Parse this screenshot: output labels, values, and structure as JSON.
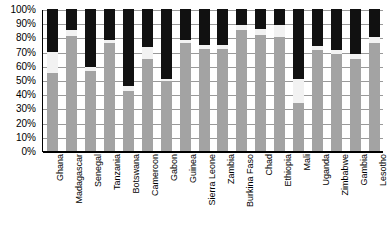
{
  "chart_data": {
    "type": "bar",
    "subtype": "stacked-bar-100-percent",
    "title": "",
    "xlabel": "",
    "ylabel": "",
    "ylim": [
      0,
      100
    ],
    "grid": true,
    "legend": "none",
    "orientation": "vertical",
    "stacked": true,
    "y_tick_labels": [
      "100%",
      "90%",
      "80%",
      "70%",
      "60%",
      "50%",
      "40%",
      "30%",
      "20%",
      "10%",
      "0%"
    ],
    "y_tick_values": [
      100,
      90,
      80,
      70,
      60,
      50,
      40,
      30,
      20,
      10,
      0
    ],
    "categories": [
      "Ghana",
      "Madagascar",
      "Senegal",
      "Tanzania",
      "Botswana",
      "Cameroon",
      "Gabon",
      "Guinea",
      "Sierra Leone",
      "Zambia",
      "Burkina Faso",
      "Chad",
      "Ethiopia",
      "Mali",
      "Uganda",
      "Zimbabwe",
      "Gambia",
      "Lesotho"
    ],
    "series": [
      {
        "name": "bottom-segment",
        "color": "#a3a3a3",
        "values": [
          55,
          81,
          56,
          76,
          42,
          65,
          49,
          76,
          72,
          72,
          85,
          82,
          80,
          34,
          71,
          68,
          65,
          76
        ]
      },
      {
        "name": "middle-segment",
        "color": "#f2f2f2",
        "values": [
          15,
          4,
          3,
          2,
          4,
          8,
          2,
          2,
          3,
          3,
          4,
          4,
          9,
          17,
          3,
          3,
          3,
          4
        ]
      },
      {
        "name": "top-segment",
        "color": "#111111",
        "values": [
          30,
          15,
          41,
          22,
          54,
          27,
          49,
          22,
          25,
          25,
          11,
          14,
          11,
          49,
          26,
          29,
          32,
          20
        ]
      }
    ],
    "segment_cumulative_tops": [
      [
        55,
        70,
        100
      ],
      [
        81,
        85,
        100
      ],
      [
        56,
        59,
        100
      ],
      [
        76,
        78,
        100
      ],
      [
        42,
        46,
        100
      ],
      [
        65,
        73,
        100
      ],
      [
        49,
        51,
        100
      ],
      [
        76,
        78,
        100
      ],
      [
        72,
        75,
        100
      ],
      [
        72,
        75,
        100
      ],
      [
        85,
        89,
        100
      ],
      [
        82,
        86,
        100
      ],
      [
        80,
        89,
        100
      ],
      [
        34,
        51,
        100
      ],
      [
        71,
        74,
        100
      ],
      [
        68,
        71,
        100
      ],
      [
        65,
        68,
        100
      ],
      [
        76,
        80,
        100
      ]
    ]
  },
  "colors": {
    "bottom": "#a3a3a3",
    "middle": "#f2f2f2",
    "top": "#111111",
    "grid": "#9a9a9a",
    "axis": "#000000",
    "background": "#ffffff"
  }
}
